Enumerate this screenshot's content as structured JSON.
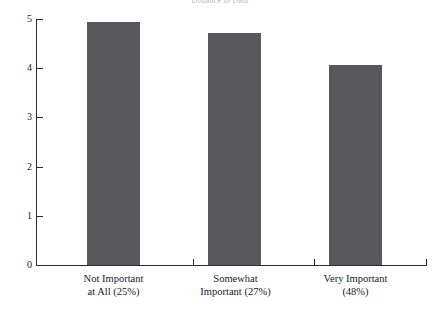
{
  "chart_data": {
    "type": "bar",
    "title": "Distance in Dam",
    "xlabel": "",
    "ylabel": "",
    "categories": [
      "Not Important at All (25%)",
      "Somewhat Important (27%)",
      "Very Important (48%)"
    ],
    "category_lines": [
      [
        "Not Important",
        "at All (25%)"
      ],
      [
        "Somewhat",
        "Important (27%)"
      ],
      [
        "Very Important",
        "(48%)"
      ]
    ],
    "values": [
      4.93,
      4.72,
      4.06
    ],
    "ylim": [
      0,
      5
    ],
    "yticks": [
      0,
      1,
      2,
      3,
      4,
      5
    ],
    "ytick_labels": [
      "0",
      "1",
      "2",
      "3",
      "4",
      "5"
    ],
    "grid": false,
    "legend": null,
    "bar_color": "#58585a",
    "axis_color": "#2b2b2b",
    "background": "#ffffff"
  },
  "axis": {
    "y_tick_labels": [
      "5",
      "4",
      "3",
      "2",
      "1",
      "0"
    ]
  }
}
